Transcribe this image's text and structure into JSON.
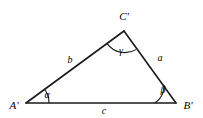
{
  "figure": {
    "type": "geometry-diagram",
    "shape": "triangle",
    "background_color": "#ffffff",
    "stroke_color": "#1a1a1a",
    "text_color": "#000000"
  },
  "vertices": [
    {
      "id": "A",
      "label": "A'",
      "x": 26,
      "y": 103,
      "label_x": 14,
      "label_y": 105
    },
    {
      "id": "B",
      "label": "B'",
      "x": 176,
      "y": 103,
      "label_x": 188,
      "label_y": 105
    },
    {
      "id": "C",
      "label": "C'",
      "x": 124,
      "y": 31,
      "label_x": 124,
      "label_y": 16
    }
  ],
  "sides": [
    {
      "id": "a",
      "label": "a",
      "from": "C",
      "to": "B",
      "label_x": 160,
      "label_y": 58
    },
    {
      "id": "b",
      "label": "b",
      "from": "A",
      "to": "C",
      "label_x": 70,
      "label_y": 60
    },
    {
      "id": "c",
      "label": "c",
      "from": "A",
      "to": "B",
      "label_x": 104,
      "label_y": 111
    }
  ],
  "angles": [
    {
      "id": "alpha",
      "label": "α",
      "at": "A",
      "label_x": 47,
      "label_y": 95
    },
    {
      "id": "beta",
      "label": "β",
      "at": "B",
      "label_x": 163,
      "label_y": 90
    },
    {
      "id": "gamma",
      "label": "γ",
      "at": "C",
      "label_x": 121,
      "label_y": 51
    }
  ]
}
